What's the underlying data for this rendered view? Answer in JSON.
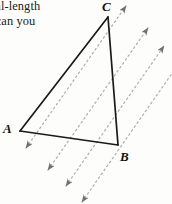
{
  "figure": {
    "title_text_visible": true,
    "caption": {
      "line1": "ual-length",
      "line2": "t can you"
    },
    "vertices": {
      "A": {
        "label": "A",
        "x": 20,
        "y": 131
      },
      "B": {
        "label": "B",
        "x": 118,
        "y": 145
      },
      "C": {
        "label": "C",
        "x": 108,
        "y": 17
      }
    },
    "colors": {
      "triangle_stroke": "#1a1a1a",
      "dashed_vector_stroke": "#b0b0b0",
      "arrowhead_fill": "#6e6e6e",
      "text": "#1a1a1a",
      "background": "#fdfdfc"
    },
    "triangle": {
      "name": "triangle-ABC",
      "stroke_width": 1.6,
      "sides": [
        {
          "name": "side-AC",
          "from": "A",
          "to": "C"
        },
        {
          "name": "side-CB",
          "from": "C",
          "to": "B"
        },
        {
          "name": "side-AB",
          "from": "A",
          "to": "B"
        }
      ]
    },
    "vectors": {
      "count": 4,
      "style": "dashed",
      "double_headed": true,
      "direction_label": "parallel translation vectors",
      "lines": [
        {
          "name": "vector-1",
          "x1": 26,
          "y1": 148,
          "x2": 126,
          "y2": 6
        },
        {
          "name": "vector-2",
          "x1": 48,
          "y1": 170,
          "x2": 148,
          "y2": 28
        },
        {
          "name": "vector-3",
          "x1": 66,
          "y1": 186,
          "x2": 164,
          "y2": 46
        },
        {
          "name": "vector-4",
          "x1": 82,
          "y1": 202,
          "x2": 178,
          "y2": 64
        }
      ]
    }
  }
}
